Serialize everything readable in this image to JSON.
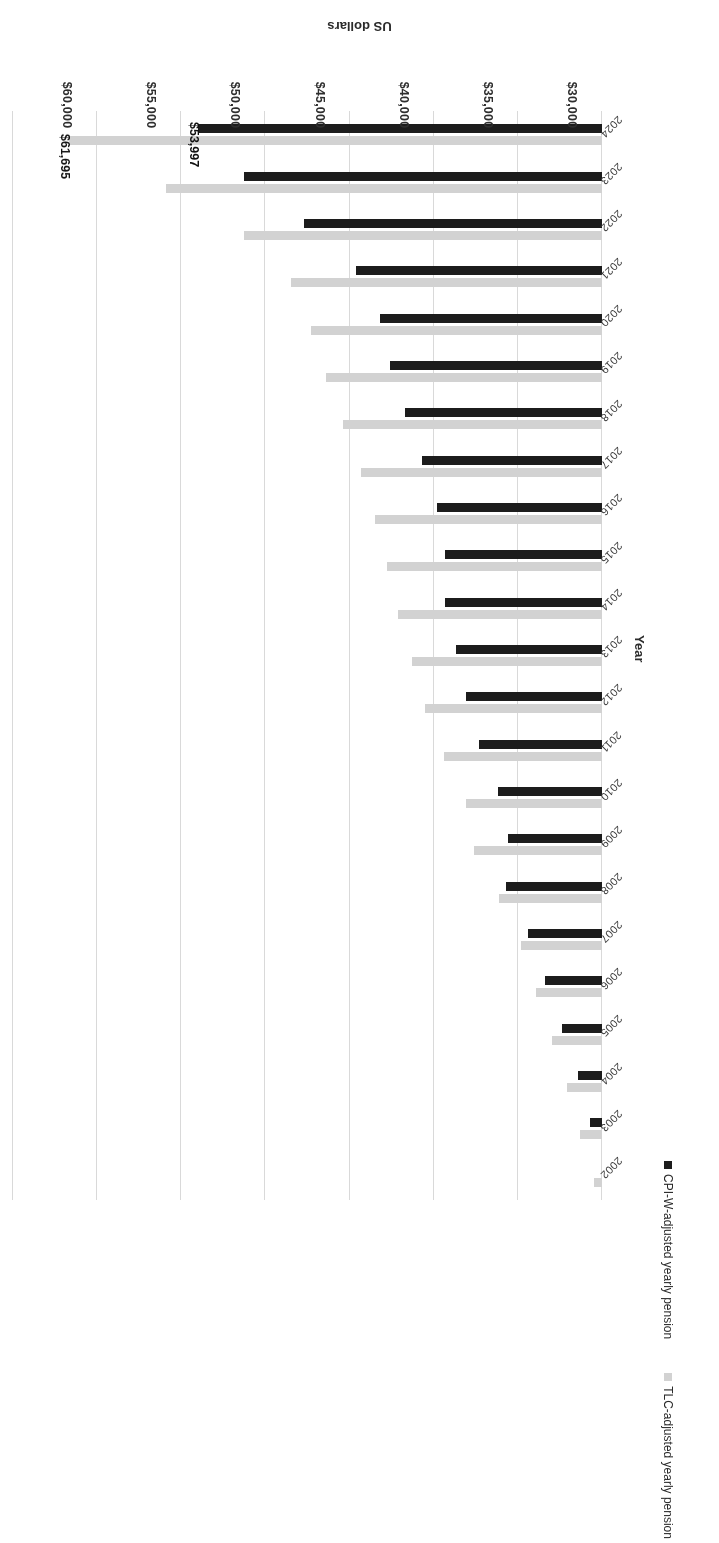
{
  "chart_data": {
    "type": "bar",
    "orientation": "vertical-rotated",
    "title": "",
    "xlabel": "Year",
    "ylabel": "US dollars",
    "ylim": [
      30000,
      65000
    ],
    "ytick_labels": [
      "$30,000",
      "$35,000",
      "$40,000",
      "$45,000",
      "$50,000",
      "$55,000",
      "$60,000",
      "$65,000"
    ],
    "ytick_values": [
      30000,
      35000,
      40000,
      45000,
      50000,
      55000,
      60000,
      65000
    ],
    "grid": true,
    "legend_position": "bottom",
    "categories": [
      "2002",
      "2003",
      "2004",
      "2005",
      "2006",
      "2007",
      "2008",
      "2009",
      "2010",
      "2011",
      "2012",
      "2013",
      "2014",
      "2015",
      "2016",
      "2017",
      "2018",
      "2019",
      "2020",
      "2021",
      "2022",
      "2023",
      "2024"
    ],
    "series": [
      {
        "name": "TLC-adjusted yearly pension",
        "color": "#d2d2d2",
        "values": [
          30500,
          31300,
          32100,
          33000,
          33900,
          34800,
          36100,
          37600,
          38100,
          39400,
          40500,
          41300,
          42100,
          42800,
          43500,
          44300,
          45400,
          46400,
          47300,
          48500,
          51300,
          55900,
          61695
        ]
      },
      {
        "name": "CPI-W-adjusted yearly pension",
        "color": "#1c1c1c",
        "values": [
          30000,
          30700,
          31400,
          32400,
          33400,
          34400,
          35700,
          35600,
          36200,
          37300,
          38100,
          38700,
          39300,
          39300,
          39800,
          40700,
          41700,
          42600,
          43200,
          44600,
          47700,
          51300,
          53997
        ]
      }
    ],
    "data_labels": [
      {
        "series": "TLC-adjusted yearly pension",
        "category": "2024",
        "text": "$61,695"
      },
      {
        "series": "CPI-W-adjusted yearly pension",
        "category": "2024",
        "text": "$53,997"
      }
    ]
  },
  "axes": {
    "value_axis_title": "US dollars",
    "category_axis_title": "Year"
  },
  "legend": {
    "items": [
      {
        "label": "CPI-W-adjusted yearly pension",
        "marker": "square-dark",
        "color": "#1c1c1c"
      },
      {
        "label": "TLC-adjusted yearly pension",
        "marker": "square-light",
        "color": "#d2d2d2"
      }
    ]
  }
}
